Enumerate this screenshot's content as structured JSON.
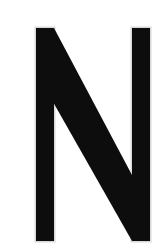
{
  "canvas": {
    "width": 167,
    "height": 251,
    "background_color": "#ffffff"
  },
  "glyph": {
    "character": "N",
    "name": "capital-letter-n",
    "description": "Capital letter N, condensed sans-serif, black on white",
    "ink_color": "#0d0d0d",
    "halo_color": "#d8d8d8",
    "bounds": {
      "left": 36,
      "top": 28,
      "right": 150,
      "bottom": 241,
      "width": 114,
      "height": 213
    },
    "strokes": {
      "left_stem": {
        "name": "left-vertical-stem",
        "x": 36,
        "y": 28,
        "width": 18,
        "height": 213
      },
      "right_stem": {
        "name": "right-vertical-stem",
        "x": 132,
        "y": 28,
        "width": 18,
        "height": 213
      },
      "diagonal": {
        "name": "diagonal-stroke",
        "start_x": 36,
        "start_y": 28,
        "end_x": 150,
        "end_y": 241,
        "thickness": 17,
        "points": "36,28 54,28 150,209 150,241 132,241 36,72"
      }
    }
  }
}
